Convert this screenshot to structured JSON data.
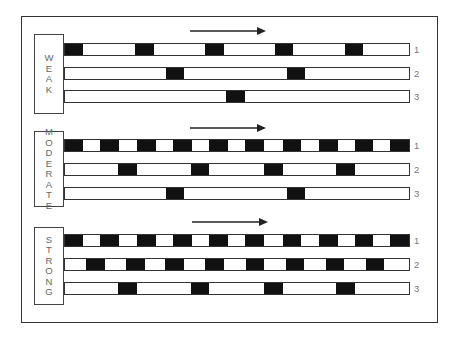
{
  "diagram": {
    "sections": [
      {
        "label": "WEAK",
        "letters": [
          "W",
          "E",
          "A",
          "K"
        ],
        "label_box": {
          "top": 34,
          "height": 80
        },
        "arrow": {
          "x1": 190,
          "x2": 266,
          "y": 31
        },
        "rows": [
          {
            "number": "1",
            "top": 43,
            "blocks": [
              [
                0,
                19
              ],
              [
                71,
                19
              ],
              [
                141,
                19
              ],
              [
                211,
                18
              ],
              [
                281,
                18
              ]
            ]
          },
          {
            "number": "2",
            "top": 67,
            "blocks": [
              [
                102,
                18
              ],
              [
                223,
                18
              ]
            ]
          },
          {
            "number": "3",
            "top": 90,
            "blocks": [
              [
                162,
                19
              ]
            ]
          }
        ]
      },
      {
        "label": "MODERATE",
        "letters": [
          "M",
          "O",
          "D",
          "E",
          "R",
          "A",
          "T",
          "E"
        ],
        "label_box": {
          "top": 131,
          "height": 76
        },
        "arrow": {
          "x1": 190,
          "x2": 266,
          "y": 128
        },
        "rows": [
          {
            "number": "1",
            "top": 139,
            "blocks": [
              [
                0,
                19
              ],
              [
                36,
                19
              ],
              [
                73,
                19
              ],
              [
                109,
                19
              ],
              [
                145,
                19
              ],
              [
                181,
                19
              ],
              [
                219,
                18
              ],
              [
                255,
                19
              ],
              [
                291,
                18
              ],
              [
                326,
                20
              ]
            ]
          },
          {
            "number": "2",
            "top": 163,
            "blocks": [
              [
                54,
                19
              ],
              [
                127,
                18
              ],
              [
                200,
                19
              ],
              [
                272,
                19
              ]
            ]
          },
          {
            "number": "3",
            "top": 187,
            "blocks": [
              [
                102,
                18
              ],
              [
                223,
                18
              ]
            ]
          }
        ]
      },
      {
        "label": "STRONG",
        "letters": [
          "S",
          "T",
          "R",
          "O",
          "N",
          "G"
        ],
        "label_box": {
          "top": 227,
          "height": 78
        },
        "arrow": {
          "x1": 192,
          "x2": 268,
          "y": 222
        },
        "rows": [
          {
            "number": "1",
            "top": 234,
            "blocks": [
              [
                0,
                19
              ],
              [
                36,
                19
              ],
              [
                73,
                19
              ],
              [
                109,
                19
              ],
              [
                145,
                19
              ],
              [
                181,
                19
              ],
              [
                219,
                18
              ],
              [
                255,
                19
              ],
              [
                291,
                18
              ],
              [
                326,
                20
              ]
            ]
          },
          {
            "number": "2",
            "top": 258,
            "blocks": [
              [
                22,
                19
              ],
              [
                62,
                19
              ],
              [
                101,
                19
              ],
              [
                141,
                19
              ],
              [
                182,
                18
              ],
              [
                222,
                18
              ],
              [
                262,
                18
              ],
              [
                302,
                18
              ]
            ]
          },
          {
            "number": "3",
            "top": 282,
            "blocks": [
              [
                54,
                19
              ],
              [
                127,
                18
              ],
              [
                200,
                19
              ],
              [
                272,
                19
              ]
            ]
          }
        ]
      }
    ]
  }
}
